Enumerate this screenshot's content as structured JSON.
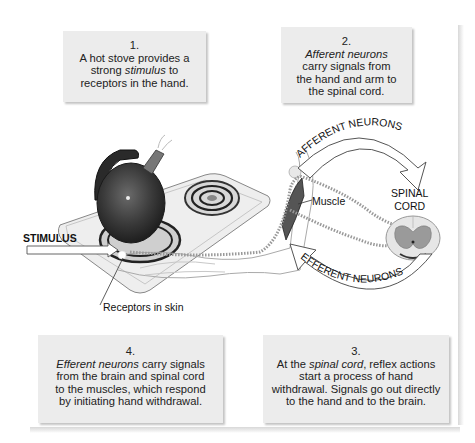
{
  "captions": {
    "box1": {
      "number": "1.",
      "line1": "A hot stove provides a",
      "line2_pre": "strong ",
      "line2_em": "stimulus",
      "line2_post": " to",
      "line3": "receptors in the hand."
    },
    "box2": {
      "number": "2.",
      "line1_em": "Afferent neurons",
      "line2": "carry signals from",
      "line3": "the hand and arm to",
      "line4": "the spinal cord."
    },
    "box3": {
      "number": "3.",
      "line1_pre": "At the ",
      "line1_em": "spinal cord",
      "line1_post": ", reflex actions",
      "line2": "start a process of hand",
      "line3": "withdrawal. Signals go out directly",
      "line4": "to the hand and to the brain."
    },
    "box4": {
      "number": "4.",
      "line1_em": "Efferent neurons",
      "line1_post": " carry signals",
      "line2": "from the brain and spinal cord",
      "line3": "to the muscles, which respond",
      "line4": "by initiating hand withdrawal."
    }
  },
  "labels": {
    "stimulus": "STIMULUS",
    "muscle": "Muscle",
    "receptors": "Receptors in skin",
    "spinal_line1": "SPINAL",
    "spinal_line2": "CORD",
    "afferent": "AFFERENT NEURONS",
    "efferent": "EFFERENT NEURONS"
  },
  "colors": {
    "caption_bg": "#ececec",
    "kettle": "#3a3a3a",
    "stove": "#e6e6e6",
    "arrow_fill": "#ffffff",
    "arrow_stroke": "#555555",
    "spinal_gray": "#9a9a9a"
  }
}
